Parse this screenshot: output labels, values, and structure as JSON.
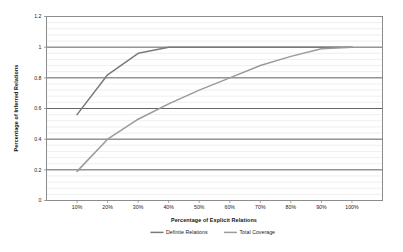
{
  "chart_data": {
    "type": "line",
    "title": "",
    "xlabel": "Percentage of Explicit Relations",
    "ylabel": "Percentage of Inferred Relations",
    "xlim": [
      0,
      110
    ],
    "ylim": [
      0,
      1.2
    ],
    "grid": true,
    "legend_position": "bottom",
    "x_tick_labels": [
      "10%",
      "20%",
      "30%",
      "40%",
      "50%",
      "60%",
      "70%",
      "80%",
      "90%",
      "100%"
    ],
    "x_tick_values": [
      10,
      20,
      30,
      40,
      50,
      60,
      70,
      80,
      90,
      100
    ],
    "y_tick_labels": [
      "0",
      "0.2",
      "0.4",
      "0.6",
      "0.8",
      "1",
      "1.2"
    ],
    "y_tick_values": [
      0,
      0.2,
      0.4,
      0.6,
      0.8,
      1,
      1.2
    ],
    "x": [
      10,
      20,
      30,
      40,
      50,
      60,
      70,
      80,
      90,
      100
    ],
    "series": [
      {
        "name": "Definite Relations",
        "color": "#7a7a7a",
        "values": [
          0.56,
          0.82,
          0.96,
          1.0,
          1.0,
          1.0,
          1.0,
          1.0,
          1.0,
          1.0
        ]
      },
      {
        "name": "Total Coverage",
        "color": "#9a9a9a",
        "values": [
          0.19,
          0.4,
          0.53,
          0.63,
          0.72,
          0.8,
          0.88,
          0.94,
          0.99,
          1.0
        ]
      }
    ],
    "colors": {
      "plot_border": "#8c8c8c",
      "major_gridline": "#555555",
      "minor_gridline": "#e8e8e8",
      "background": "#ffffff",
      "text": "#1a1a1a"
    }
  },
  "legend": {
    "items": [
      {
        "label": "Definite Relations"
      },
      {
        "label": "Total Coverage"
      }
    ]
  }
}
